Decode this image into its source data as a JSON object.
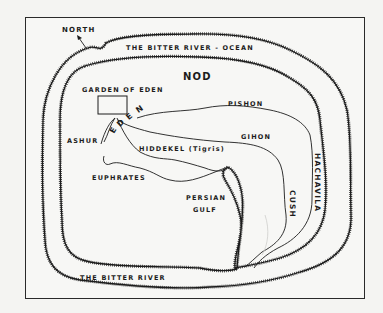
{
  "map": {
    "title": "Map of Eden and surrounding lands",
    "compass": {
      "label": "NORTH",
      "icon": "north-arrow-icon"
    },
    "waters": {
      "outer_top": "THE BITTER RIVER - OCEAN",
      "outer_bottom": "THE BITTER RIVER",
      "gulf_line1": "PERSIAN",
      "gulf_line2": "GULF"
    },
    "regions": {
      "nod": "NOD",
      "garden": "GARDEN OF EDEN",
      "eden_e1": "E",
      "eden_d": "D",
      "eden_e2": "E",
      "eden_n": "N",
      "ashur": "ASHUR",
      "cush": "CUSH",
      "hachavila": "HACHAVILA"
    },
    "rivers": {
      "pishon": "PISHON",
      "gihon": "GIHON",
      "hiddekel": "HIDDEKEL (Tigris)",
      "euphrates": "EUPHRATES"
    },
    "colors": {
      "ink": "#1c1c1c",
      "paper": "#f7f7f5",
      "frame": "#2a2a2a"
    }
  }
}
